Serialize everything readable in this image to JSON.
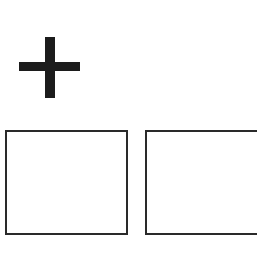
{
  "diagram": {
    "symbol": {
      "icon": "plus-icon",
      "color": "#1c1c1c"
    },
    "boxes": [
      {
        "id": "left",
        "label": "",
        "border_color": "#2a2a2a"
      },
      {
        "id": "right",
        "label": "",
        "border_color": "#2a2a2a"
      }
    ]
  }
}
